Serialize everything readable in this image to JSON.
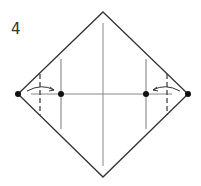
{
  "diagram": {
    "step_number": "4",
    "shape": "diamond (square folded corner-up)",
    "colors": {
      "line": "#333333",
      "guide": "#999999",
      "dot": "#111111"
    },
    "elements": [
      "outer diamond outline",
      "vertical center crease",
      "horizontal center crease",
      "left inner vertical crease",
      "right inner vertical crease",
      "left dashed fold line",
      "right dashed fold line",
      "left curved arrow pointing right",
      "right curved arrow pointing left",
      "four reference dots on horizontal line"
    ]
  }
}
